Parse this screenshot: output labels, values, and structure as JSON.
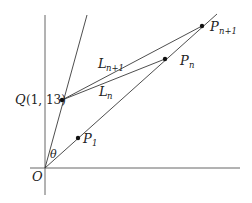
{
  "diagram": {
    "origin_label": "O",
    "angle_label": "θ",
    "point_Q": {
      "name": "Q",
      "coords": "(1, 13)"
    },
    "point_P1": {
      "name": "P",
      "sub": "1"
    },
    "point_Pn": {
      "name": "P",
      "sub": "n"
    },
    "point_Pn1": {
      "name": "P",
      "sub": "n+1"
    },
    "line_Ln": {
      "name": "L",
      "sub": "n"
    },
    "line_Ln1": {
      "name": "L",
      "sub": "n+1"
    },
    "colors": {
      "line": "#3a3a3a",
      "point": "#111111",
      "text": "#222222"
    }
  }
}
